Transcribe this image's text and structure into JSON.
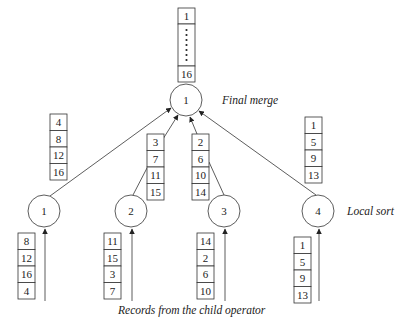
{
  "diagram": {
    "colors": {
      "stroke": "#333333",
      "text": "#222222",
      "background": "#ffffff"
    },
    "labels": {
      "final_merge": "Final merge",
      "local_sort": "Local sort",
      "input_caption": "Records from the child operator"
    },
    "root": {
      "id": "1",
      "label": "1",
      "cx": 186,
      "cy": 100
    },
    "output": {
      "x": 178,
      "y": 8,
      "top": "1",
      "bottom": "16",
      "ellipsis": "•••••"
    },
    "local_nodes": [
      {
        "label": "1",
        "cx": 44,
        "cy": 211,
        "sorted_run": {
          "x": 50,
          "y": 114,
          "values": [
            "4",
            "8",
            "12",
            "16"
          ]
        },
        "input": {
          "x": 18,
          "y": 233,
          "values": [
            "8",
            "12",
            "16",
            "4"
          ]
        }
      },
      {
        "label": "2",
        "cx": 131,
        "cy": 211,
        "sorted_run": {
          "x": 147,
          "y": 134,
          "values": [
            "3",
            "7",
            "11",
            "15"
          ]
        },
        "input": {
          "x": 104,
          "y": 233,
          "values": [
            "11",
            "15",
            "3",
            "7"
          ]
        }
      },
      {
        "label": "3",
        "cx": 224,
        "cy": 211,
        "sorted_run": {
          "x": 192,
          "y": 134,
          "values": [
            "2",
            "6",
            "10",
            "14"
          ]
        },
        "input": {
          "x": 197,
          "y": 233,
          "values": [
            "14",
            "2",
            "6",
            "10"
          ]
        }
      },
      {
        "label": "4",
        "cx": 318,
        "cy": 211,
        "sorted_run": {
          "x": 305,
          "y": 117,
          "values": [
            "1",
            "5",
            "9",
            "13"
          ]
        },
        "input": {
          "x": 294,
          "y": 237,
          "values": [
            "1",
            "5",
            "9",
            "13"
          ]
        }
      }
    ]
  }
}
